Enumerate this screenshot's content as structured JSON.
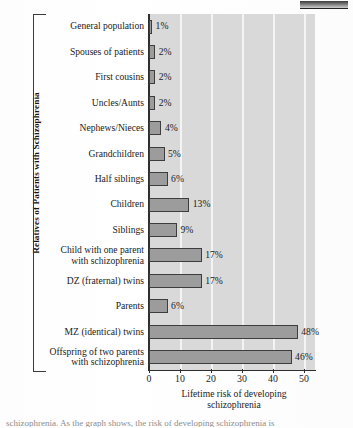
{
  "figure": {
    "y_axis_title": "Relatives of Patients with Schizophrenia",
    "x_axis_title": "Lifetime risk of developing\nschizophrenia",
    "caption_partial": "schizophrenia. As the graph shows, the risk of developing schizophrenia is"
  },
  "chart_data": {
    "type": "bar",
    "orientation": "horizontal",
    "title": "",
    "xlabel": "Lifetime risk of developing schizophrenia",
    "ylabel": "Relatives of Patients with Schizophrenia",
    "xlim": [
      0,
      54
    ],
    "xticks": [
      0,
      10,
      20,
      30,
      40,
      50
    ],
    "xtick_labels": [
      "0",
      "10",
      "20",
      "30",
      "40",
      "50"
    ],
    "grid": true,
    "grid_axis": "x",
    "legend": null,
    "unit": "%",
    "plot_background": "#d9d9d9",
    "bar_fill": "#9c9c9c",
    "bar_edge": "#3d3d3d",
    "categories": [
      "General population",
      "Spouses of patients",
      "First cousins",
      "Uncles/Aunts",
      "Nephews/Nieces",
      "Grandchildren",
      "Half siblings",
      "Children",
      "Siblings",
      "Child with one parent\nwith schizophrenia",
      "DZ (fraternal) twins",
      "Parents",
      "MZ (identical) twins",
      "Offspring of two parents\nwith schizophrenia"
    ],
    "values": [
      1,
      2,
      2,
      2,
      4,
      5,
      6,
      13,
      9,
      17,
      17,
      6,
      48,
      46
    ],
    "value_labels": [
      "1%",
      "2%",
      "2%",
      "2%",
      "4%",
      "5%",
      "6%",
      "13%",
      "9%",
      "17%",
      "17%",
      "6%",
      "48%",
      "46%"
    ]
  }
}
